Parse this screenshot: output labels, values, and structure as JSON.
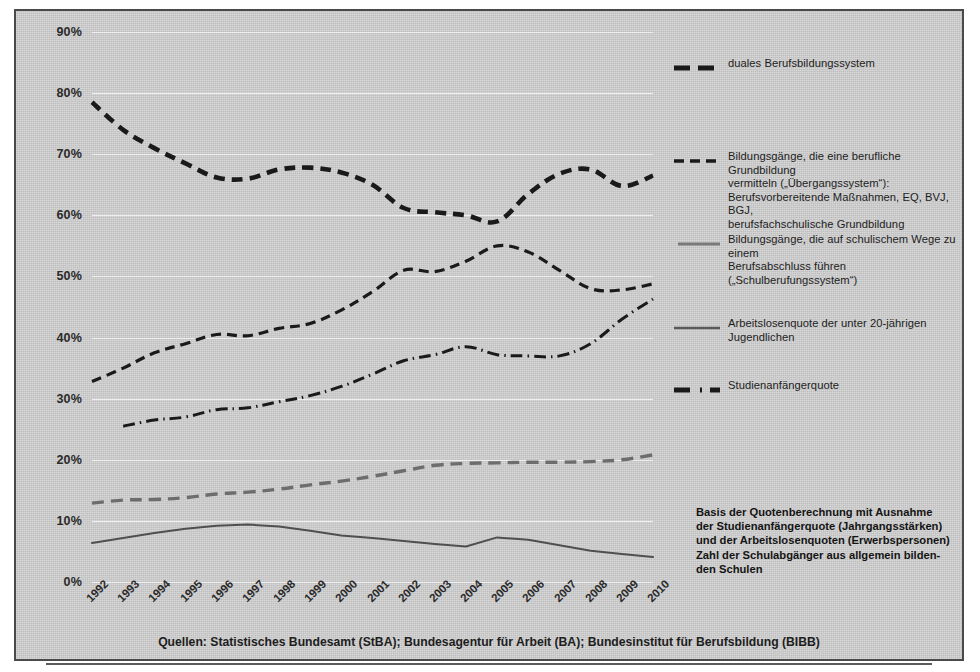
{
  "chart_data": {
    "type": "line",
    "title": "",
    "xlabel": "",
    "ylabel": "",
    "ylim": [
      0,
      90
    ],
    "ytick_values": [
      0,
      10,
      20,
      30,
      40,
      50,
      60,
      70,
      80,
      90
    ],
    "ytick_labels": [
      "0%",
      "10%",
      "20%",
      "30%",
      "40%",
      "50%",
      "60%",
      "70%",
      "80%",
      "90%"
    ],
    "grid": true,
    "legend_position": "right",
    "categories": [
      "1992",
      "1993",
      "1994",
      "1995",
      "1996",
      "1997",
      "1998",
      "1999",
      "2000",
      "2001",
      "2002",
      "2003",
      "2004",
      "2005",
      "2006",
      "2007",
      "2008",
      "2009",
      "2010"
    ],
    "series": [
      {
        "name": "duales Berufsbildungssystem",
        "style": "thick-dashed",
        "color": "#1a1a1a",
        "values": [
          78.5,
          74.0,
          71.0,
          68.5,
          66.2,
          66.0,
          67.5,
          67.8,
          67.0,
          65.0,
          61.2,
          60.5,
          60.0,
          59.0,
          63.5,
          66.8,
          67.5,
          64.8,
          66.5
        ]
      },
      {
        "name": "Bildungsgänge, die eine berufliche Grundbildung vermitteln („Übergangssystem“): Berufsvorbereitende Maßnahmen, EQ, BVJ, BGJ, berufsfachschulische Grundbildung",
        "style": "dashed",
        "color": "#1a1a1a",
        "values": [
          32.8,
          35.0,
          37.5,
          39.0,
          40.5,
          40.3,
          41.5,
          42.3,
          44.5,
          47.5,
          51.0,
          50.8,
          52.5,
          55.0,
          54.0,
          51.0,
          48.0,
          47.8,
          48.8
        ]
      },
      {
        "name": "Bildungsgänge, die auf schulischem Wege zu einem Berufsabschluss führen („Schulberufungssystem“)",
        "style": "gray-dashed",
        "color": "#6d6d6d",
        "values": [
          12.9,
          13.4,
          13.5,
          13.8,
          14.4,
          14.7,
          15.2,
          15.9,
          16.5,
          17.3,
          18.2,
          19.1,
          19.4,
          19.5,
          19.6,
          19.6,
          19.7,
          20.0,
          20.8
        ]
      },
      {
        "name": "Arbeitslosenquote der unter 20-jährigen Jugendlichen",
        "style": "solid",
        "color": "#4f4f4f",
        "values": [
          6.4,
          7.2,
          8.0,
          8.7,
          9.2,
          9.4,
          9.1,
          8.4,
          7.6,
          7.2,
          6.7,
          6.2,
          5.8,
          7.3,
          6.9,
          6.0,
          5.1,
          4.6,
          4.1
        ]
      },
      {
        "name": "Studienanfängerquote",
        "style": "dash-dot",
        "color": "#1a1a1a",
        "values": [
          null,
          25.5,
          26.5,
          27.0,
          28.2,
          28.5,
          29.5,
          30.5,
          32.0,
          34.0,
          36.2,
          37.2,
          38.5,
          37.2,
          37.0,
          37.0,
          39.0,
          43.0,
          46.3
        ]
      }
    ]
  },
  "legend": {
    "items": [
      {
        "key": "thick-dashed-key-icon",
        "lines": [
          "duales Berufsbildungssystem"
        ]
      },
      {
        "key": "dashed-key-icon",
        "lines": [
          "Bildungsgänge, die eine berufliche Grundbildung",
          "vermitteln („Übergangssystem“):",
          "Berufsvorbereitende Maßnahmen, EQ, BVJ, BGJ,",
          "berufsfachschulische Grundbildung"
        ]
      },
      {
        "key": "gray-solid-key-icon",
        "lines": [
          "Bildungsgänge, die auf schulischem Wege zu einem",
          "Berufsabschluss führen („Schulberufungssystem“)"
        ]
      },
      {
        "key": "solid-key-icon",
        "lines": [
          "Arbeitslosenquote der unter 20-jährigen Jugendlichen"
        ]
      },
      {
        "key": "dash-dot-key-icon",
        "lines": [
          "Studienanfängerquote"
        ]
      }
    ]
  },
  "note": {
    "lines": [
      "Basis der Quotenberechnung mit Ausnahme",
      "der Studienanfängerquote (Jahrgangsstärken)",
      "und der Arbeitslosenquoten (Erwerbspersonen)",
      "Zahl der Schulabgänger aus allgemein bilden-",
      "den Schulen"
    ]
  },
  "source": {
    "text": "Quellen: Statistisches Bundesamt (StBA); Bundesagentur für Arbeit (BA); Bundesinstitut für Berufsbildung (BIBB)"
  },
  "colors": {
    "background": "#c9c9c9",
    "frame_border": "#4a4a4a",
    "gridline": "#efefef",
    "dark_series": "#1a1a1a",
    "gray_series": "#6d6d6d",
    "solid_series": "#4f4f4f"
  }
}
